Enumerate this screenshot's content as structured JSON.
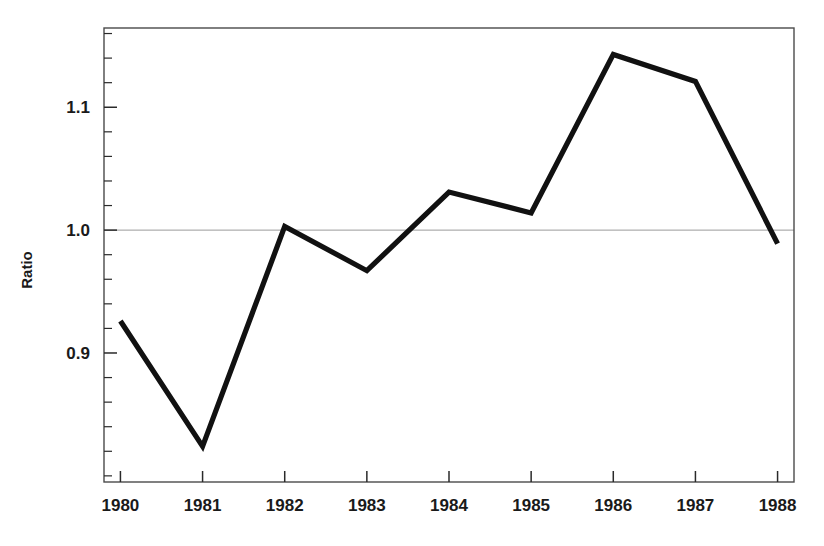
{
  "chart_data": {
    "type": "line",
    "title": "",
    "subtitle": "",
    "xlabel": "",
    "ylabel": "Ratio",
    "categories": [
      "1980",
      "1981",
      "1982",
      "1983",
      "1984",
      "1985",
      "1986",
      "1987",
      "1988"
    ],
    "x": [
      1980,
      1981,
      1982,
      1983,
      1984,
      1985,
      1986,
      1987,
      1988
    ],
    "values": [
      0.926,
      0.824,
      1.003,
      0.967,
      1.031,
      1.014,
      1.143,
      1.121,
      0.989
    ],
    "series": [
      {
        "name": "Ratio",
        "values": [
          0.926,
          0.824,
          1.003,
          0.967,
          1.031,
          1.014,
          1.143,
          1.121,
          0.989
        ],
        "color": "#111111",
        "line_width": 5.2
      }
    ],
    "xlim": [
      1979.8,
      1988.2
    ],
    "ylim": [
      0.795,
      1.1645
    ],
    "y_major_ticks": [
      0.9,
      1.0,
      1.1
    ],
    "y_major_tick_labels": [
      "0.9",
      "1.0",
      "1.1"
    ],
    "y_minor_tick_step": 0.02,
    "x_tick_labels": [
      "1980",
      "1981",
      "1982",
      "1983",
      "1984",
      "1985",
      "1986",
      "1987",
      "1988"
    ],
    "grid": "horizontal-single",
    "gridlines": [
      1.0
    ],
    "grid_color": "#9a9a9a",
    "legend": "none",
    "legend_position": "none",
    "frame": "full-box",
    "frame_color": "#4a4a4a",
    "background_color": "#ffffff",
    "annotations": []
  },
  "axis": {
    "y_title": "Ratio",
    "y_labels": [
      "1.1",
      "1.0",
      "0.9"
    ],
    "x_labels": [
      "1980",
      "1981",
      "1982",
      "1983",
      "1984",
      "1985",
      "1986",
      "1987",
      "1988"
    ]
  }
}
